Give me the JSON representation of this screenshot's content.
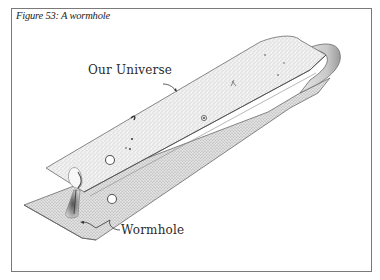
{
  "figure": {
    "caption": "Figure 53: A wormhole",
    "labels": {
      "universe": "Our Universe",
      "wormhole": "Wormhole"
    },
    "colors": {
      "frame": "#7a7a7a",
      "sheet_fill": "#ececec",
      "sheet_edge": "#6a6a6a",
      "ink": "#2a2a2a"
    }
  }
}
